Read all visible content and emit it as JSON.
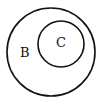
{
  "diagram": {
    "type": "venn-subset",
    "outer_set": {
      "label": "B",
      "cx": 51,
      "cy": 52,
      "r": 44
    },
    "inner_set": {
      "label": "C",
      "cx": 61,
      "cy": 44,
      "r": 23
    },
    "stroke_color": "#111111",
    "background": "#ffffff"
  }
}
